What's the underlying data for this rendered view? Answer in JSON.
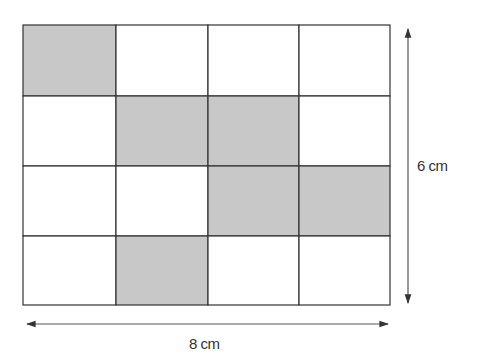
{
  "diagram": {
    "grid": {
      "rows": 4,
      "cols": 4,
      "shaded_cells": [
        [
          0,
          0
        ],
        [
          1,
          1
        ],
        [
          1,
          2
        ],
        [
          2,
          2
        ],
        [
          2,
          3
        ],
        [
          3,
          1
        ]
      ],
      "shade_color": "#c8c8c8",
      "line_color": "#333333"
    },
    "height_label": "6 cm",
    "width_label": "8 cm"
  }
}
